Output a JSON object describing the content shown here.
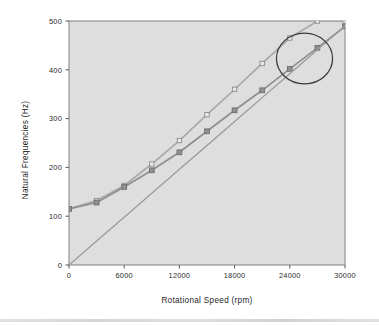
{
  "figure": {
    "background_color": "#ffffff",
    "plot_background_color": "#dedede",
    "frame_color": "#8a8a8a"
  },
  "chart_data": {
    "type": "line",
    "title": "",
    "subtitle": "",
    "xlabel": "Rotational Speed (rpm)",
    "ylabel": "Natural Frequencies (Hz)",
    "xlim": [
      0,
      30000
    ],
    "ylim": [
      0,
      500
    ],
    "xticks": [
      0,
      6000,
      12000,
      18000,
      24000,
      30000
    ],
    "yticks": [
      0,
      100,
      200,
      300,
      400,
      500
    ],
    "xtick_labels": [
      "0",
      "6000",
      "12000",
      "18000",
      "24000",
      "30000"
    ],
    "ytick_labels": [
      "0",
      "100",
      "200",
      "300",
      "400",
      "500"
    ],
    "grid": false,
    "legend": false,
    "legend_position": "none",
    "x": [
      0,
      3000,
      6000,
      9000,
      12000,
      15000,
      18000,
      21000,
      24000,
      27000,
      30000
    ],
    "series": [
      {
        "name": "forward-whirl",
        "marker": "open-square",
        "color": "#a9a9a9",
        "marker_fill": "#e8e8e8",
        "values": [
          115,
          132,
          163,
          207,
          255,
          308,
          360,
          413,
          465,
          500,
          500
        ]
      },
      {
        "name": "backward-whirl",
        "marker": "filled-square",
        "color": "#8f8f8f",
        "marker_fill": "#909090",
        "values": [
          115,
          128,
          160,
          194,
          231,
          274,
          317,
          358,
          402,
          445,
          489
        ]
      },
      {
        "name": "excitation-1x-line",
        "marker": "none",
        "color": "#9a9a9a",
        "marker_fill": "none",
        "values": [
          0,
          49,
          98,
          147,
          196,
          245,
          294,
          343,
          392,
          441,
          490
        ]
      }
    ],
    "annotations": [
      {
        "name": "critical-speed-circle",
        "shape": "circle",
        "x": 25600,
        "y": 423,
        "radius_x": 3050,
        "radius_y": 52,
        "color": "#3a3a3a",
        "label": ""
      }
    ]
  }
}
